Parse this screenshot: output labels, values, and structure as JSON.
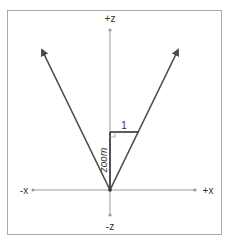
{
  "diagram": {
    "type": "field-of-view / zoom geometry",
    "axes": {
      "pos_z": "+z",
      "neg_z": "-z",
      "pos_x": "+x",
      "neg_x": "-x"
    },
    "labels": {
      "opposite_side": "1",
      "adjacent_side": "zoom"
    },
    "colors": {
      "frame": "#a8a8a8",
      "axis": "#9a9a9a",
      "ray": "#4a4a4a",
      "text": "#333333"
    }
  }
}
